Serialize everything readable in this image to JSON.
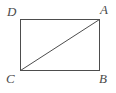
{
  "figure": {
    "kind": "rectangle-with-diagonal",
    "background_color": "#ffffff",
    "stroke_color": "#4d4d4d",
    "stroke_width": 1,
    "label_color": "#4a4a4a",
    "rect": {
      "left": 20,
      "top": 19,
      "right": 99,
      "bottom": 70,
      "width": 79,
      "height": 51
    },
    "diagonal": {
      "from": "C",
      "to": "A",
      "x1": 20,
      "y1": 70,
      "x2": 99,
      "y2": 19
    },
    "vertices": [
      {
        "id": "D",
        "label": "D",
        "corner": "top-left",
        "x": 20,
        "y": 19
      },
      {
        "id": "A",
        "label": "A",
        "corner": "top-right",
        "x": 99,
        "y": 19
      },
      {
        "id": "B",
        "label": "B",
        "corner": "bottom-right",
        "x": 99,
        "y": 70
      },
      {
        "id": "C",
        "label": "C",
        "corner": "bottom-left",
        "x": 20,
        "y": 70
      }
    ]
  }
}
